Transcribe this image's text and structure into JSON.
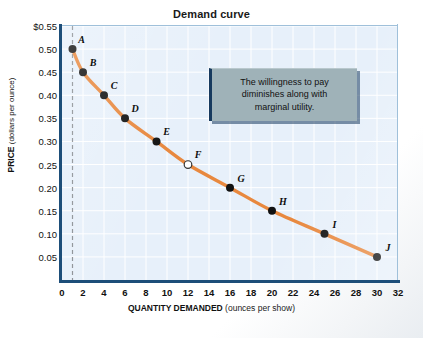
{
  "chart_data": {
    "type": "line",
    "title": "Demand curve",
    "xlabel_bold": "QUANTITY DEMANDED",
    "xlabel_sub": "(ounces per show)",
    "ylabel_bold": "PRICE",
    "ylabel_sub": "(dollars per ounce)",
    "xlim": [
      0,
      32
    ],
    "ylim": [
      0,
      0.55
    ],
    "grid": true,
    "legend": "none",
    "x_ticks": [
      0,
      2,
      4,
      6,
      8,
      10,
      12,
      14,
      16,
      18,
      20,
      22,
      24,
      26,
      28,
      30,
      32
    ],
    "x_tick_labels": [
      "0",
      "2",
      "4",
      "6",
      "8",
      "10",
      "12",
      "14",
      "16",
      "18",
      "20",
      "22",
      "24",
      "26",
      "28",
      "30",
      "32"
    ],
    "y_ticks": [
      0.05,
      0.1,
      0.15,
      0.2,
      0.25,
      0.3,
      0.35,
      0.4,
      0.45,
      0.5,
      0.55
    ],
    "y_tick_labels": [
      "0.05",
      "0.10",
      "0.15",
      "0.20",
      "0.25",
      "0.30",
      "0.35",
      "0.40",
      "0.45",
      "0.50",
      "$0.55"
    ],
    "series": [
      {
        "name": "Demand",
        "color": "#e8883e",
        "points": [
          {
            "label": "A",
            "x": 1,
            "y": 0.5,
            "marker": "filled",
            "label_dx": 9,
            "label_dy": -10
          },
          {
            "label": "B",
            "x": 2,
            "y": 0.45,
            "marker": "filled",
            "label_dx": 10,
            "label_dy": -10
          },
          {
            "label": "C",
            "x": 4,
            "y": 0.4,
            "marker": "filled",
            "label_dx": 10,
            "label_dy": -10
          },
          {
            "label": "D",
            "x": 6,
            "y": 0.35,
            "marker": "filled",
            "label_dx": 10,
            "label_dy": -10
          },
          {
            "label": "E",
            "x": 9,
            "y": 0.3,
            "marker": "filled",
            "label_dx": 10,
            "label_dy": -10
          },
          {
            "label": "F",
            "x": 12,
            "y": 0.25,
            "marker": "open",
            "label_dx": 10,
            "label_dy": -11
          },
          {
            "label": "G",
            "x": 16,
            "y": 0.2,
            "marker": "filled",
            "label_dx": 11,
            "label_dy": -10
          },
          {
            "label": "H",
            "x": 20,
            "y": 0.15,
            "marker": "filled",
            "label_dx": 11,
            "label_dy": -10
          },
          {
            "label": "I",
            "x": 25,
            "y": 0.1,
            "marker": "filled",
            "label_dx": 10,
            "label_dy": -10
          },
          {
            "label": "J",
            "x": 30,
            "y": 0.05,
            "marker": "filled",
            "label_dx": 11,
            "label_dy": -10
          }
        ]
      }
    ],
    "reference_line": {
      "type": "vertical-dashed",
      "x": 1,
      "color": "#8a8f94"
    },
    "annotations": [
      {
        "name": "willingness-to-pay-callout",
        "lines": [
          "The willingness to pay",
          "diminishes along with",
          "marginal utility."
        ]
      }
    ],
    "colors": {
      "plot_background": "#e7f0fa",
      "gridline": "#ffffff",
      "axis": "#1d4e79",
      "curve": "#e8883e",
      "marker_fill": "#111111",
      "callout_bg": "#9fb2b8",
      "callout_border": "#173a5e"
    }
  }
}
